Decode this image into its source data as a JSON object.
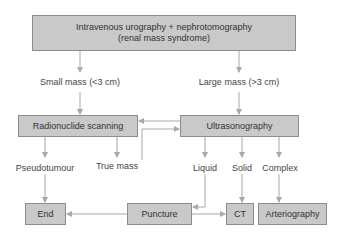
{
  "diagram": {
    "type": "flowchart",
    "colors": {
      "box_fill": "#c9c9c9",
      "box_border": "#8c8c8c",
      "connector": "#a8a8a8",
      "text": "#333333"
    },
    "nodes": {
      "start": {
        "line1": "Intravenous urography + nephrotomography",
        "line2": "(renal mass syndrome)"
      },
      "radionuclide": {
        "label": "Radionuclide scanning"
      },
      "ultrasonography": {
        "label": "Ultrasonography"
      },
      "end": {
        "label": "End"
      },
      "puncture": {
        "label": "Puncture"
      },
      "ct": {
        "label": "CT"
      },
      "arteriography": {
        "label": "Arteriography"
      }
    },
    "labels": {
      "small_mass": "Small mass (<3 cm)",
      "large_mass": "Large mass (>3 cm)",
      "pseudotumour": "Pseudotumour",
      "true_mass": "True mass",
      "liquid": "Liquid",
      "solid": "Solid",
      "complex": "Complex"
    },
    "edges": [
      {
        "from": "start",
        "to": "radionuclide",
        "via": "Small mass (<3 cm)"
      },
      {
        "from": "start",
        "to": "ultrasonography",
        "via": "Large mass (>3 cm)"
      },
      {
        "from": "ultrasonography",
        "to": "radionuclide"
      },
      {
        "from": "radionuclide",
        "to": "ultrasonography",
        "via": "True mass"
      },
      {
        "from": "radionuclide",
        "to": "end",
        "via": "Pseudotumour"
      },
      {
        "from": "ultrasonography",
        "to": "puncture",
        "via": "Liquid"
      },
      {
        "from": "ultrasonography",
        "to": "ct",
        "via": "Solid"
      },
      {
        "from": "ultrasonography",
        "to": "arteriography",
        "via": "Complex"
      },
      {
        "from": "puncture",
        "to": "end"
      },
      {
        "from": "puncture",
        "to": "ct"
      }
    ]
  }
}
